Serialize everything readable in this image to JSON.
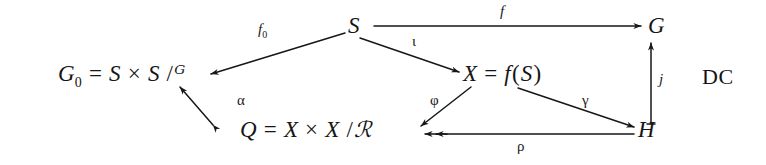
{
  "diagram": {
    "type": "commutative-diagram",
    "corner_tag": "DC",
    "background_color": "#ffffff",
    "ink_color": "#161616",
    "nodes": [
      {
        "id": "S",
        "label": "S",
        "x": 352,
        "y": 28
      },
      {
        "id": "G",
        "label": "G",
        "x": 653,
        "y": 28
      },
      {
        "id": "G0",
        "label": "G₀ = S × S /𝒢",
        "lhs": "G",
        "lhs_sub": "0",
        "eq": "=",
        "rhs_a": "S",
        "times": "×",
        "rhs_b": "S",
        "slash": "/",
        "quotient": "ᴳ",
        "x": 60,
        "y": 76
      },
      {
        "id": "X",
        "label": "X = f(S)",
        "lhs": "X",
        "eq": "=",
        "fn": "f",
        "open": "(",
        "arg": "S",
        "close": ")",
        "x": 468,
        "y": 76
      },
      {
        "id": "Q",
        "label": "Q = X × X /ℛ",
        "lhs": "Q",
        "eq": "=",
        "rhs_a": "X",
        "times": "×",
        "rhs_b": "X",
        "slash": "/",
        "quotient": "ℛ",
        "x": 243,
        "y": 131
      },
      {
        "id": "H",
        "label": "H",
        "x": 642,
        "y": 131
      }
    ],
    "arrows": [
      {
        "id": "f",
        "from": "S",
        "to": "G",
        "label": "f",
        "label_x": 500,
        "label_y": 11,
        "heads": "single"
      },
      {
        "id": "f0",
        "from": "S",
        "to": "G0",
        "label": "f",
        "label_sub": "0",
        "label_x": 261,
        "label_y": 29,
        "heads": "single"
      },
      {
        "id": "i",
        "from": "S",
        "to": "X",
        "label": "ι",
        "label_x": 414,
        "label_y": 41,
        "heads": "single"
      },
      {
        "id": "phi",
        "from": "X",
        "to": "Q",
        "label": "φ",
        "label_x": 432,
        "label_y": 100,
        "heads": "single"
      },
      {
        "id": "gamma",
        "from": "X",
        "to": "H",
        "label": "γ",
        "label_x": 584,
        "label_y": 100,
        "heads": "single"
      },
      {
        "id": "rho",
        "from": "H",
        "to": "Q",
        "label": "ρ",
        "label_x": 519,
        "label_y": 145,
        "heads": "single"
      },
      {
        "id": "j",
        "from": "H",
        "to": "G",
        "label": "j",
        "label_x": 660,
        "label_y": 79,
        "heads": "single"
      },
      {
        "id": "alpha",
        "from": "Q",
        "to": "G0",
        "label": "α",
        "label_x": 239,
        "label_y": 100,
        "heads": "single"
      }
    ]
  }
}
